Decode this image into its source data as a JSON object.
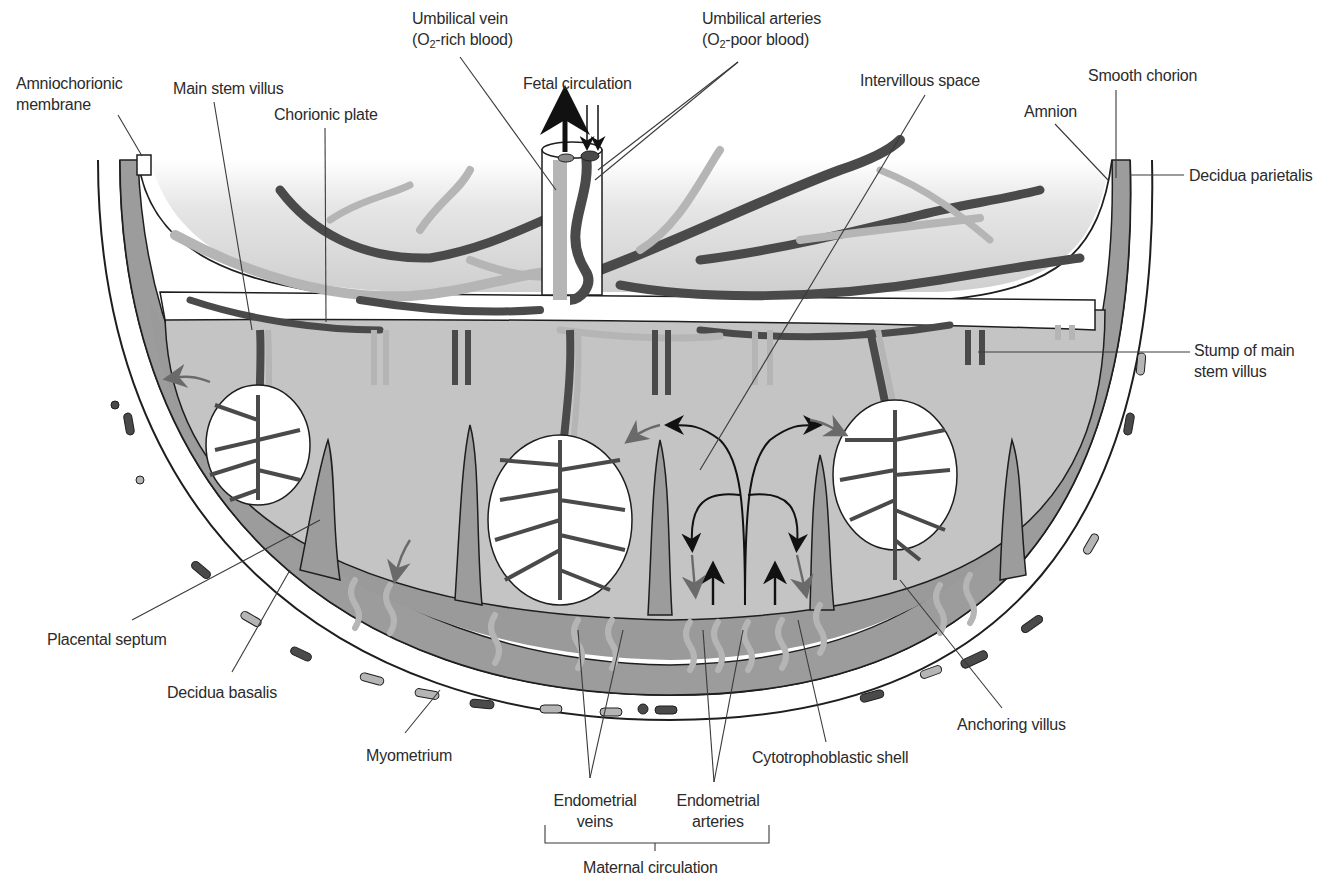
{
  "figure": {
    "type": "diagram",
    "colors": {
      "background": "#ffffff",
      "decidua": "#9c9c9c",
      "intervillous_space": "#c4c4c4",
      "chorionic_fade": "#d8d8d8",
      "vessel_dark": "#4a4a4a",
      "vessel_light": "#b5b5b5",
      "outline": "#1e1e1e",
      "arrow_black": "#111111",
      "arrow_gray": "#6a6a6a"
    }
  },
  "labels": {
    "umbilical_vein": {
      "line1": "Umbilical vein",
      "line2_pre": "(O",
      "line2_sub": "2",
      "line2_post": "-rich blood)"
    },
    "umbilical_arteries": {
      "line1": "Umbilical arteries",
      "line2_pre": "(O",
      "line2_sub": "2",
      "line2_post": "-poor blood)"
    },
    "fetal_circulation": "Fetal circulation",
    "amniochorionic_membrane": {
      "line1": "Amniochorionic",
      "line2": "membrane"
    },
    "main_stem_villus": "Main stem villus",
    "chorionic_plate": "Chorionic plate",
    "intervillous_space": "Intervillous space",
    "smooth_chorion": "Smooth chorion",
    "amnion": "Amnion",
    "decidua_parietalis": "Decidua parietalis",
    "stump_of_main_stem_villus": {
      "line1": "Stump of main",
      "line2": "stem villus"
    },
    "placental_septum": "Placental septum",
    "decidua_basalis": "Decidua basalis",
    "myometrium": "Myometrium",
    "endometrial_veins": {
      "line1": "Endometrial",
      "line2": "veins"
    },
    "endometrial_arteries": {
      "line1": "Endometrial",
      "line2": "arteries"
    },
    "cytotrophoblastic_shell": "Cytotrophoblastic shell",
    "anchoring_villus": "Anchoring villus",
    "maternal_circulation": "Maternal circulation"
  }
}
